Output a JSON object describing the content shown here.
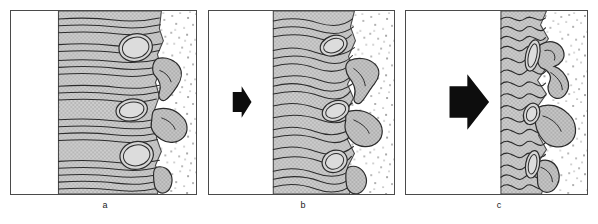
{
  "figure": {
    "title": "",
    "background_color": "#ffffff",
    "width": 598,
    "height": 224,
    "panel_count": 3
  },
  "colors": {
    "outline": "#4a4a4a",
    "line_dark": "#2b2b2b",
    "tissue_gray": "#c9c9c9",
    "lobe_gray": "#bdbdbd",
    "stipple_dot": "#3a3a3a",
    "white": "#ffffff",
    "arrow_black": "#0d0d0d",
    "label_text": "#1a1a1a"
  },
  "panels": [
    {
      "id": "a",
      "label": "a",
      "arrow": {
        "present": false,
        "size": "none",
        "direction": "right"
      },
      "zones": [
        {
          "name": "lumen-zone",
          "fill": "white",
          "x": 1,
          "width": 47
        },
        {
          "name": "fibrous-tissue-zone",
          "fill": "tissue_gray",
          "x": 48,
          "width": 97
        },
        {
          "name": "stippled-matrix-zone",
          "fill": "stipple",
          "x": 145,
          "width": 41
        }
      ],
      "wave_amplitude": 2,
      "wave_count": 22,
      "ovals": [
        {
          "cx": 126,
          "cy": 37,
          "rx": 17,
          "ry": 14,
          "rotation": -12
        },
        {
          "cx": 122,
          "cy": 100,
          "rx": 16,
          "ry": 11,
          "rotation": -10
        },
        {
          "cx": 127,
          "cy": 146,
          "rx": 17,
          "ry": 14,
          "rotation": -12
        }
      ],
      "lobes": [
        {
          "name": "lobe-upper",
          "cx": 155,
          "cy": 62,
          "size": "medium"
        },
        {
          "name": "lobe-middle",
          "cx": 158,
          "cy": 112,
          "size": "large"
        },
        {
          "name": "lobe-lower",
          "cx": 150,
          "cy": 170,
          "size": "small"
        }
      ]
    },
    {
      "id": "b",
      "label": "b",
      "arrow": {
        "present": true,
        "size": "small",
        "direction": "right"
      },
      "zones": [
        {
          "name": "lumen-zone",
          "fill": "white",
          "x": 1,
          "width": 64
        },
        {
          "name": "fibrous-tissue-zone",
          "fill": "tissue_gray",
          "x": 65,
          "width": 75
        },
        {
          "name": "stippled-matrix-zone",
          "fill": "stipple",
          "x": 140,
          "width": 46
        }
      ],
      "wave_amplitude": 4,
      "wave_count": 20,
      "ovals": [
        {
          "cx": 126,
          "cy": 35,
          "rx": 14,
          "ry": 10,
          "rotation": -20
        },
        {
          "cx": 128,
          "cy": 101,
          "rx": 14,
          "ry": 10,
          "rotation": -22
        },
        {
          "cx": 127,
          "cy": 152,
          "rx": 13,
          "ry": 11,
          "rotation": -25
        }
      ],
      "lobes": [
        {
          "name": "lobe-upper",
          "cx": 152,
          "cy": 66,
          "size": "medium"
        },
        {
          "name": "lobe-middle",
          "cx": 158,
          "cy": 116,
          "size": "large"
        },
        {
          "name": "lobe-lower",
          "cx": 143,
          "cy": 170,
          "size": "small"
        }
      ]
    },
    {
      "id": "c",
      "label": "c",
      "arrow": {
        "present": true,
        "size": "large",
        "direction": "right"
      },
      "zones": [
        {
          "name": "lumen-zone",
          "fill": "white",
          "x": 1,
          "width": 95
        },
        {
          "name": "fibrous-tissue-zone",
          "fill": "tissue_gray",
          "x": 96,
          "width": 44
        },
        {
          "name": "stippled-matrix-zone",
          "fill": "stipple",
          "x": 140,
          "width": 42
        }
      ],
      "wave_amplitude": 9,
      "wave_count": 18,
      "ovals": [
        {
          "cx": 128,
          "cy": 45,
          "rx": 7,
          "ry": 16,
          "rotation": 12
        },
        {
          "cx": 127,
          "cy": 104,
          "rx": 8,
          "ry": 11,
          "rotation": 18
        },
        {
          "cx": 128,
          "cy": 155,
          "rx": 7,
          "ry": 14,
          "rotation": 10
        }
      ],
      "lobes": [
        {
          "name": "lobe-upper",
          "cx": 152,
          "cy": 55,
          "size": "contorted"
        },
        {
          "name": "lobe-middle",
          "cx": 156,
          "cy": 115,
          "size": "large-contorted"
        },
        {
          "name": "lobe-lower",
          "cx": 146,
          "cy": 168,
          "size": "small-contorted"
        }
      ]
    }
  ]
}
